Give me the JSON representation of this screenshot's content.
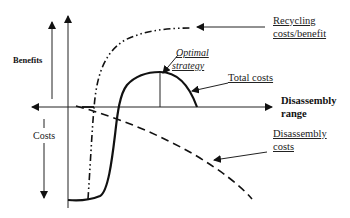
{
  "diagram": {
    "type": "cost-benefit curve diagram",
    "axes": {
      "benefits_label": "Benefits",
      "costs_label": "Costs",
      "x_axis_label_line1": "Disassembly",
      "x_axis_label_line2": "range"
    },
    "curves": [
      {
        "name": "Recycling costs/benefit",
        "style": "dash-dot",
        "label_line1": "Recycling",
        "label_line2": "costs/benefit"
      },
      {
        "name": "Total costs",
        "style": "solid",
        "label": "Total costs"
      },
      {
        "name": "Disassembly costs",
        "style": "dashed",
        "label_line1": "Disassembly",
        "label_line2": "costs"
      }
    ],
    "annotation": {
      "label_line1": "Optimal",
      "label_line2": "strategy"
    },
    "colors": {
      "line": "#111111",
      "text": "#222222",
      "background": "#ffffff"
    }
  }
}
